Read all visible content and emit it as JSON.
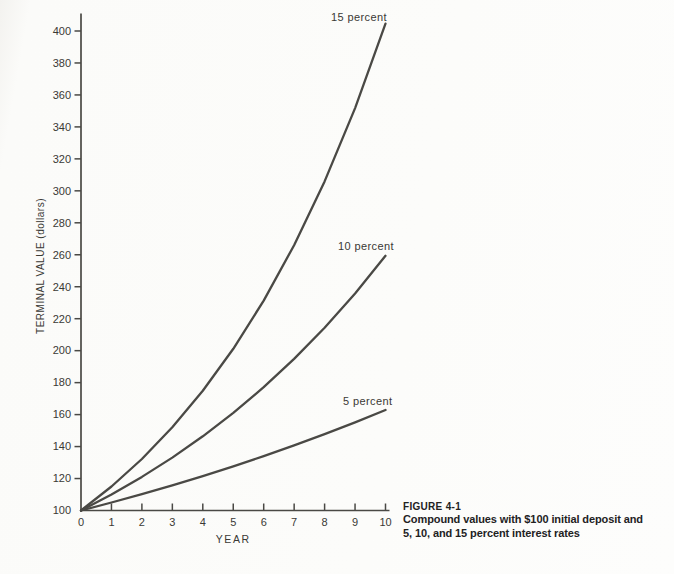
{
  "figure": {
    "label": "FIGURE 4-1",
    "caption_line1": "Compound values with $100 initial deposit and",
    "caption_line2": "5, 10, and 15 percent interest rates"
  },
  "chart_data": {
    "type": "line",
    "title": "",
    "xlabel": "YEAR",
    "ylabel": "TERMINAL VALUE (dollars)",
    "xlim": [
      0,
      10
    ],
    "ylim": [
      100,
      410
    ],
    "grid": false,
    "legend_position": "inline-labels",
    "x_ticks": [
      0,
      1,
      2,
      3,
      4,
      5,
      6,
      7,
      8,
      9,
      10
    ],
    "y_ticks": [
      100,
      120,
      140,
      160,
      180,
      200,
      220,
      240,
      260,
      280,
      300,
      320,
      340,
      360,
      380,
      400
    ],
    "x": [
      0,
      1,
      2,
      3,
      4,
      5,
      6,
      7,
      8,
      9,
      10
    ],
    "initial_deposit_dollars": 100,
    "series": [
      {
        "name": "15 percent",
        "interest_rate": 0.15,
        "values": [
          100,
          115,
          132.25,
          152.09,
          174.9,
          201.14,
          231.31,
          266.0,
          305.9,
          351.79,
          404.56
        ]
      },
      {
        "name": "10 percent",
        "interest_rate": 0.1,
        "values": [
          100,
          110,
          121,
          133.1,
          146.41,
          161.05,
          177.16,
          194.87,
          214.36,
          235.79,
          259.37
        ]
      },
      {
        "name": "5 percent",
        "interest_rate": 0.05,
        "values": [
          100,
          105,
          110.25,
          115.76,
          121.55,
          127.63,
          134.01,
          140.71,
          147.75,
          155.13,
          162.89
        ]
      }
    ],
    "colors": {
      "ink": "#4a4945",
      "curve": "#4a4945",
      "text": "#3a3935",
      "background": "#fcfcfa"
    }
  }
}
